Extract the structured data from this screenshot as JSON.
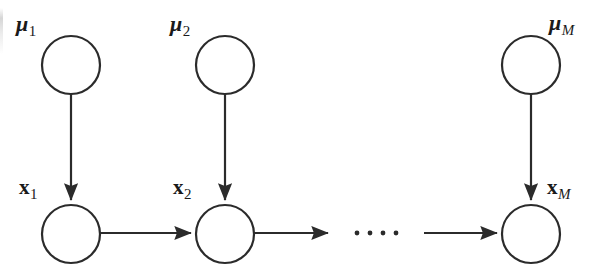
{
  "figure": {
    "type": "graphical-model-diagram",
    "width": 597,
    "height": 277,
    "background_color": "#ffffff",
    "stroke_color": "#2b2b2b",
    "stroke_width": 2.2
  },
  "labels": {
    "mu_1": {
      "symbol": "μ",
      "subscript": "1",
      "subscript_style": "number"
    },
    "mu_2": {
      "symbol": "μ",
      "subscript": "2",
      "subscript_style": "number"
    },
    "mu_M": {
      "symbol": "μ",
      "subscript": "M",
      "subscript_style": "italic"
    },
    "x_1": {
      "symbol": "x",
      "subscript": "1",
      "subscript_style": "number"
    },
    "x_2": {
      "symbol": "x",
      "subscript": "2",
      "subscript_style": "number"
    },
    "x_M": {
      "symbol": "x",
      "subscript": "M",
      "subscript_style": "italic"
    }
  },
  "nodes": {
    "mu_1": {
      "name": "mu-1-node",
      "cx": 71,
      "cy": 65,
      "rx": 29,
      "ry": 29,
      "filled": false
    },
    "mu_2": {
      "name": "mu-2-node",
      "cx": 225,
      "cy": 65,
      "rx": 29,
      "ry": 29,
      "filled": false
    },
    "mu_M": {
      "name": "mu-M-node",
      "cx": 531,
      "cy": 65,
      "rx": 29,
      "ry": 29,
      "filled": false
    },
    "x_1": {
      "name": "x-1-node",
      "cx": 71,
      "cy": 234,
      "rx": 29,
      "ry": 29,
      "filled": false
    },
    "x_2": {
      "name": "x-2-node",
      "cx": 225,
      "cy": 234,
      "rx": 29,
      "ry": 29,
      "filled": false
    },
    "x_M": {
      "name": "x-M-node",
      "cx": 531,
      "cy": 234,
      "rx": 29,
      "ry": 29,
      "filled": false
    }
  },
  "edges": [
    {
      "name": "edge-mu1-to-x1",
      "from": "mu_1",
      "to": "x_1",
      "orientation": "vertical",
      "arrowhead": true
    },
    {
      "name": "edge-mu2-to-x2",
      "from": "mu_2",
      "to": "x_2",
      "orientation": "vertical",
      "arrowhead": true
    },
    {
      "name": "edge-muM-to-xM",
      "from": "mu_M",
      "to": "x_M",
      "orientation": "vertical",
      "arrowhead": true
    },
    {
      "name": "edge-x1-to-x2",
      "from": "x_1",
      "to": "x_2",
      "orientation": "horizontal",
      "arrowhead": true
    },
    {
      "name": "edge-x2-to-ellipsis",
      "from": "x_2",
      "to": "ellipsis",
      "orientation": "horizontal",
      "arrowhead": true
    },
    {
      "name": "edge-ellipsis-to-xM",
      "from": "ellipsis",
      "to": "x_M",
      "orientation": "horizontal",
      "arrowhead": true
    }
  ],
  "ellipsis": {
    "name": "chain-ellipsis",
    "dot_count": 4,
    "cy": 233,
    "x_start": 357,
    "spacing": 13,
    "radius": 2.4
  }
}
